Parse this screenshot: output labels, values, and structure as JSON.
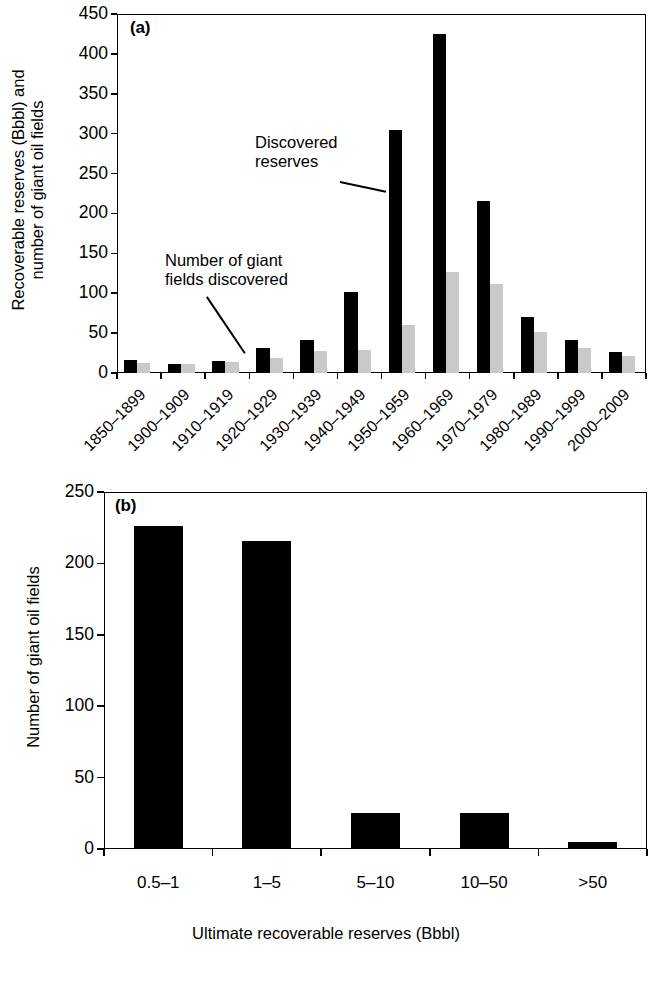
{
  "figure": {
    "panels": [
      "a",
      "b"
    ]
  },
  "panel_a": {
    "tag": "(a)",
    "ylabel": "Recoverable reserves (Bbbl) and\nnumber of giant oil fields",
    "annotation_reserves": "Discovered\nreserves",
    "annotation_fields": "Number of giant\nfields discovered",
    "yticks": [
      "0",
      "50",
      "100",
      "150",
      "200",
      "250",
      "300",
      "350",
      "400",
      "450"
    ]
  },
  "panel_b": {
    "tag": "(b)",
    "ylabel": "Number of giant oil fields",
    "xlabel": "Ultimate recoverable reserves (Bbbl)",
    "yticks": [
      "0",
      "50",
      "100",
      "150",
      "200",
      "250"
    ]
  },
  "chart_data": [
    {
      "id": "panel-a",
      "type": "bar",
      "title": "(a)",
      "xlabel": "",
      "ylabel": "Recoverable reserves (Bbbl) and number of giant oil fields",
      "ylim": [
        0,
        450
      ],
      "ytick_step": 50,
      "grid": false,
      "legend": "annotations",
      "categories": [
        "1850–1899",
        "1900–1909",
        "1910–1919",
        "1920–1929",
        "1930–1939",
        "1940–1949",
        "1950–1959",
        "1960–1969",
        "1970–1979",
        "1980–1989",
        "1990–1999",
        "2000–2009"
      ],
      "series": [
        {
          "name": "Discovered reserves",
          "color": "#000000",
          "unit": "Bbbl",
          "values": [
            16,
            11,
            15,
            31,
            42,
            102,
            305,
            425,
            215,
            70,
            41,
            26
          ]
        },
        {
          "name": "Number of giant fields discovered",
          "color": "#c9c9c9",
          "unit": "fields",
          "values": [
            13,
            11,
            14,
            19,
            28,
            29,
            60,
            126,
            112,
            52,
            31,
            21
          ]
        }
      ]
    },
    {
      "id": "panel-b",
      "type": "bar",
      "title": "(b)",
      "xlabel": "Ultimate recoverable reserves (Bbbl)",
      "ylabel": "Number of giant oil fields",
      "ylim": [
        0,
        250
      ],
      "ytick_step": 50,
      "grid": false,
      "categories": [
        "0.5–1",
        "1–5",
        "5–10",
        "10–50",
        ">50"
      ],
      "values": [
        226,
        216,
        25,
        25,
        5
      ],
      "color": "#000000"
    }
  ]
}
